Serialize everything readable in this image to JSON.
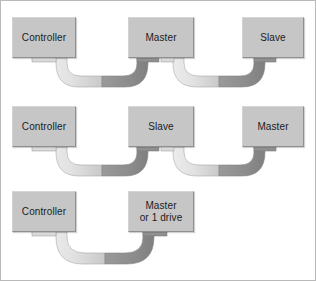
{
  "figure": {
    "background_color": "#ffffff",
    "border_color": "#b9b9b9",
    "box_fill_color": "#c6c6c6",
    "box_border_color": "#8f8f8f",
    "cable_light_color": "#e8e8e8",
    "cable_dark_color": "#8c8c8c",
    "cable_mid_color": "#bdbdbd"
  },
  "rows": [
    {
      "name": "row-three-device",
      "boxes": [
        {
          "label": "Controller",
          "x": 11,
          "y": 16,
          "w": 64,
          "h": 41
        },
        {
          "label": "Master",
          "x": 127,
          "y": 16,
          "w": 66,
          "h": 41
        },
        {
          "label": "Slave",
          "x": 241,
          "y": 16,
          "w": 62,
          "h": 41
        }
      ]
    },
    {
      "name": "row-slave-master",
      "boxes": [
        {
          "label": "Controller",
          "x": 11,
          "y": 105,
          "w": 64,
          "h": 41
        },
        {
          "label": "Slave",
          "x": 127,
          "y": 105,
          "w": 66,
          "h": 41
        },
        {
          "label": "Master",
          "x": 241,
          "y": 105,
          "w": 62,
          "h": 41
        }
      ]
    },
    {
      "name": "row-single-drive",
      "boxes": [
        {
          "label": "Controller",
          "x": 11,
          "y": 190,
          "w": 64,
          "h": 41
        },
        {
          "label": "Master\nor 1 drive",
          "x": 127,
          "y": 190,
          "w": 66,
          "h": 41
        }
      ]
    }
  ]
}
